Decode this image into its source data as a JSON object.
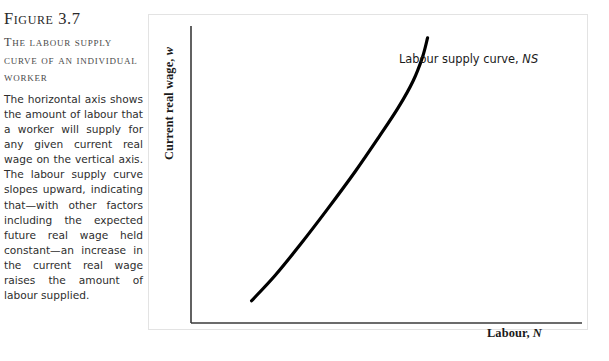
{
  "figure": {
    "number_label": "Figure 3.7",
    "subtitle": "The labour supply curve of an individual worker",
    "caption_body": "The horizontal axis shows the amount of labour that a worker will supply for any given current real wage on the vertical axis. The labour supply curve slopes upward, indicating that—with other factors including the expected future real wage held constant—an increase in the current real wage raises the amount of labour supplied."
  },
  "chart_data": {
    "type": "line",
    "title": "The labour supply curve of an individual worker",
    "xlabel_text": "Labour, ",
    "xlabel_symbol": "N",
    "ylabel_text": "Current real wage, ",
    "ylabel_symbol": "w",
    "grid": false,
    "axis_ticks": false,
    "legend_position": "inline-annotation",
    "series": [
      {
        "name": "Labour supply curve",
        "symbol": "NS",
        "annotation_text": "Labour supply curve, ",
        "annotation_symbol": "NS",
        "color": "#000000",
        "line_width": 3.2,
        "shape": "convex-increasing",
        "x": [
          0.155,
          0.215,
          0.28,
          0.35,
          0.42,
          0.48,
          0.53,
          0.568,
          0.592,
          0.605
        ],
        "y": [
          0.075,
          0.16,
          0.265,
          0.385,
          0.51,
          0.625,
          0.725,
          0.815,
          0.895,
          0.96
        ]
      }
    ],
    "xlim": [
      0,
      1
    ],
    "ylim": [
      0,
      1
    ]
  },
  "axes": {
    "y_axis_line_color": "#3a3a3a",
    "x_axis_line_color": "#3a3a3a",
    "panel_border_color": "#e3e3e3",
    "panel_background": "#ffffff"
  }
}
